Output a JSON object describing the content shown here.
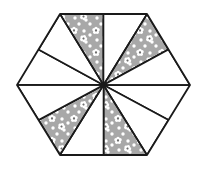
{
  "figure": {
    "type": "geometric-pattern",
    "shape": "hexagon",
    "canvas": {
      "width": 206,
      "height": 169
    },
    "center": {
      "x": 103.5,
      "y": 85
    },
    "colors": {
      "patterned_fill": "#a8a8a8",
      "plain_fill": "#ffffff",
      "outline": "#1a1a1a",
      "background": "#ffffff",
      "dot": "#ffffff",
      "flower_petal": "#ffffff",
      "flower_center": "#6e6e6e"
    },
    "stroke_width": 1.6,
    "hexagon_vertices": [
      {
        "name": "top-left",
        "x": 60,
        "y": 14
      },
      {
        "name": "top-right",
        "x": 147,
        "y": 14
      },
      {
        "name": "right",
        "x": 190,
        "y": 85
      },
      {
        "name": "bottom-right",
        "x": 147,
        "y": 155
      },
      {
        "name": "bottom-left",
        "x": 60,
        "y": 155
      },
      {
        "name": "left",
        "x": 17,
        "y": 85
      }
    ],
    "edge_midpoints": [
      {
        "name": "top",
        "x": 103.5,
        "y": 14
      },
      {
        "name": "upper-right",
        "x": 168.5,
        "y": 49.5
      },
      {
        "name": "lower-right",
        "x": 168.5,
        "y": 120
      },
      {
        "name": "bottom",
        "x": 103.5,
        "y": 155
      },
      {
        "name": "lower-left",
        "x": 38.5,
        "y": 120
      },
      {
        "name": "upper-left",
        "x": 38.5,
        "y": 49.5
      }
    ],
    "pinwheel": {
      "arms": 6,
      "rotation_direction": "counter-clockwise",
      "arm_fill": "patterned",
      "gap_fill": "plain",
      "description": "Six congruent patterned parallelograms radiate from the hexagon centre, each spanning one sector; six plain white triangles fill the gaps between them."
    },
    "patterned_pieces": [
      {
        "id": 1,
        "points": "103.5,85 60,14 147,14 103.5,85"
      },
      {
        "id": 2,
        "points": "103.5,85 147,14 190,85 103.5,85"
      },
      {
        "id": 3,
        "points": "103.5,85 190,85 147,155 103.5,85"
      },
      {
        "id": 4,
        "points": "103.5,85 147,155 60,155 103.5,85"
      },
      {
        "id": 5,
        "points": "103.5,85 60,155 17,85 103.5,85"
      },
      {
        "id": 6,
        "points": "103.5,85 17,85 60,14 103.5,85"
      }
    ],
    "decoration": {
      "dot_radius": 1.7,
      "dot_spacing": 11,
      "flower": {
        "petals": 5,
        "petal_radius": 1.75,
        "petal_orbit": 2.0,
        "center_radius": 1.2
      },
      "flower_count": 22,
      "dot_count": 120
    }
  }
}
